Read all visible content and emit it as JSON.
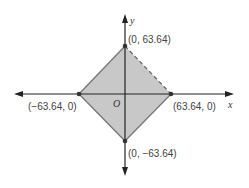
{
  "diagram": {
    "type": "coordinate-plane-region",
    "axes": {
      "x_label": "x",
      "y_label": "y",
      "origin_label": "O"
    },
    "vertices": [
      {
        "name": "top",
        "label": "(0, 63.64)"
      },
      {
        "name": "right",
        "label": "(63.64, 0)"
      },
      {
        "name": "bottom",
        "label": "(0, −63.64)"
      },
      {
        "name": "left",
        "label": "(−63.64, 0)"
      }
    ],
    "region": {
      "shape": "square (rotated 45°)",
      "fill": "#c8c8c8",
      "edge_color": "#777777",
      "dashed_edge": "top-right"
    }
  }
}
